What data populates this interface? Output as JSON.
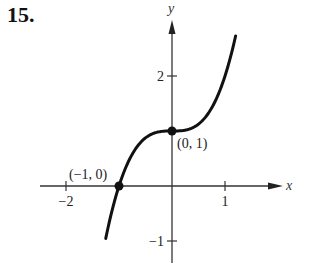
{
  "problem_number": "15.",
  "chart_data": {
    "type": "line",
    "title": "",
    "function": "y = x^3 + 1",
    "xlabel": "x",
    "ylabel": "y",
    "xlim": [
      -2.5,
      2.1
    ],
    "ylim": [
      -1.2,
      3.1
    ],
    "grid": false,
    "x_ticks": [
      {
        "value": -2,
        "label": "−2"
      },
      {
        "value": 1,
        "label": "1"
      }
    ],
    "y_ticks": [
      {
        "value": 2,
        "label": "2"
      },
      {
        "value": -1,
        "label": "−1"
      }
    ],
    "series": [
      {
        "name": "curve",
        "x": [
          -1.25,
          -1.0,
          -0.75,
          -0.5,
          -0.25,
          0.0,
          0.25,
          0.5,
          0.75,
          1.0,
          1.2
        ],
        "y": [
          -0.95,
          0.0,
          0.58,
          0.88,
          0.98,
          1.0,
          1.02,
          1.13,
          1.42,
          2.0,
          2.73
        ]
      }
    ],
    "annotations": [
      {
        "label": "(−1, 0)",
        "x": -1,
        "y": 0
      },
      {
        "label": "(0, 1)",
        "x": 0,
        "y": 1
      }
    ]
  }
}
